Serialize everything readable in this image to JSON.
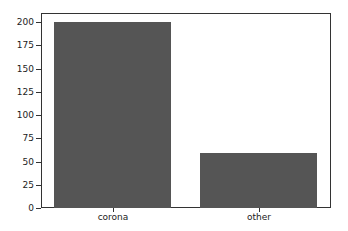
{
  "chart_data": {
    "type": "bar",
    "title": "",
    "xlabel": "",
    "ylabel": "",
    "categories": [
      "corona",
      "other"
    ],
    "values": [
      200,
      59
    ],
    "ylim": [
      0,
      210
    ],
    "yticks": [
      0,
      25,
      50,
      75,
      100,
      125,
      150,
      175,
      200
    ],
    "ytick_labels": [
      "0",
      "25",
      "50",
      "75",
      "100",
      "125",
      "150",
      "175",
      "200"
    ],
    "grid": false,
    "legend": null,
    "bar_color": "#555555"
  }
}
